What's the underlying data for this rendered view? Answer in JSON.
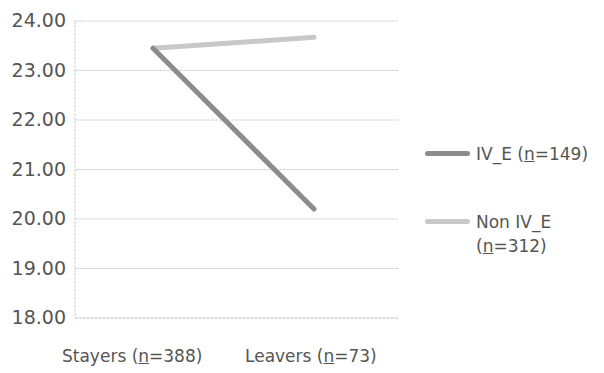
{
  "chart_data": {
    "type": "line",
    "title": "",
    "xlabel": "",
    "ylabel": "",
    "categories": [
      "Stayers (n=388)",
      "Leavers (n=73)"
    ],
    "series": [
      {
        "name": "IV_E (n=149)",
        "values": [
          23.45,
          20.2
        ],
        "color": "#8c8c8c"
      },
      {
        "name": "Non IV_E (n=312)",
        "values": [
          23.45,
          23.67
        ],
        "color": "#c8c8c8"
      }
    ],
    "ylim": [
      18,
      24
    ],
    "yticks": [
      "24.00",
      "23.00",
      "22.00",
      "21.00",
      "20.00",
      "19.00",
      "18.00"
    ],
    "grid": true,
    "legend_position": "right"
  },
  "axis": {
    "y_labels": [
      "24.00",
      "23.00",
      "22.00",
      "21.00",
      "20.00",
      "19.00",
      "18.00"
    ],
    "x_labels": [
      {
        "pre": "Stayers (",
        "n": "n",
        "post": "=388)"
      },
      {
        "pre": "Leavers (",
        "n": "n",
        "post": "=73)"
      }
    ]
  },
  "legend": [
    {
      "pre": "IV_E (",
      "n": "n",
      "post": "=149)",
      "color": "#8c8c8c"
    },
    {
      "pre": "Non IV_E (",
      "n": "n",
      "post": "=312)",
      "color": "#c8c8c8"
    }
  ]
}
